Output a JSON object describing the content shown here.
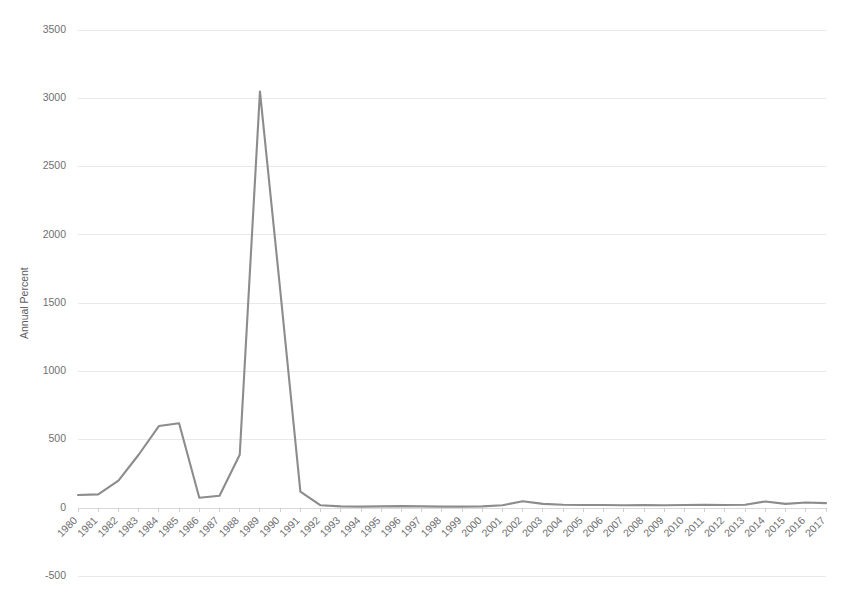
{
  "chart_data": {
    "type": "line",
    "title": "",
    "subtitle": "",
    "xlabel": "",
    "ylabel": "Annual Percent",
    "legend": [],
    "legend_position": "none",
    "grid": true,
    "grid_axis": "y",
    "xlim": [
      1980,
      2017
    ],
    "ylim": [
      -500,
      3500
    ],
    "ytick_step": 500,
    "yticks": [
      3500,
      3000,
      2500,
      2000,
      1500,
      1000,
      500,
      0,
      -500
    ],
    "ytick_labels": [
      "3500",
      "3000",
      "2500",
      "2000",
      "1500",
      "1000",
      "500",
      "0",
      "-500"
    ],
    "x": [
      1980,
      1981,
      1982,
      1983,
      1984,
      1985,
      1986,
      1987,
      1988,
      1989,
      1990,
      1991,
      1992,
      1993,
      1994,
      1995,
      1996,
      1997,
      1998,
      1999,
      2000,
      2001,
      2002,
      2003,
      2004,
      2005,
      2006,
      2007,
      2008,
      2009,
      2010,
      2011,
      2012,
      2013,
      2014,
      2015,
      2016,
      2017
    ],
    "categories": [
      "1980",
      "1981",
      "1982",
      "1983",
      "1984",
      "1985",
      "1986",
      "1987",
      "1988",
      "1989",
      "1990",
      "1991",
      "1992",
      "1993",
      "1994",
      "1995",
      "1996",
      "1997",
      "1998",
      "1999",
      "2000",
      "2001",
      "2002",
      "2003",
      "2004",
      "2005",
      "2006",
      "2007",
      "2008",
      "2009",
      "2010",
      "2011",
      "2012",
      "2013",
      "2014",
      "2015",
      "2016",
      "2017"
    ],
    "values": [
      95,
      100,
      200,
      390,
      600,
      620,
      75,
      90,
      390,
      3050,
      1600,
      120,
      20,
      12,
      10,
      12,
      14,
      12,
      10,
      10,
      12,
      20,
      50,
      30,
      24,
      22,
      22,
      20,
      22,
      20,
      22,
      24,
      22,
      24,
      48,
      30,
      40,
      36
    ],
    "series": [
      {
        "name": "Annual Percent",
        "color": "#8c8c8c",
        "values": [
          95,
          100,
          200,
          390,
          600,
          620,
          75,
          90,
          390,
          3050,
          1600,
          120,
          20,
          12,
          10,
          12,
          14,
          12,
          10,
          10,
          12,
          20,
          50,
          30,
          24,
          22,
          22,
          20,
          22,
          20,
          22,
          24,
          22,
          24,
          48,
          30,
          40,
          36
        ]
      }
    ],
    "annotations": [],
    "colors": {
      "line": "#8c8c8c",
      "gridline": "#e9e9ea",
      "axis": "#d8d8d9",
      "tick_text": "#6f6f71",
      "background": "#ffffff"
    }
  }
}
